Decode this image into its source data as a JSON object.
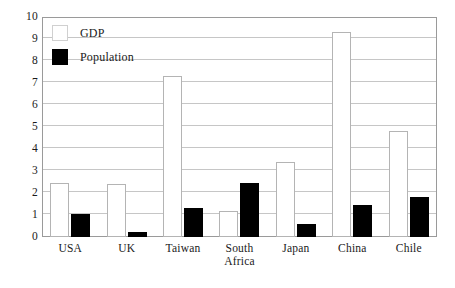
{
  "chart_data": {
    "type": "bar",
    "title": "",
    "xlabel": "",
    "ylabel": "",
    "ylim": [
      0,
      10
    ],
    "yticks": [
      0,
      1,
      2,
      3,
      4,
      5,
      6,
      7,
      8,
      9,
      10
    ],
    "grid": true,
    "legend_position": "top-left",
    "categories": [
      "USA",
      "UK",
      "Taiwan",
      "South Africa",
      "Japan",
      "China",
      "Chile"
    ],
    "series": [
      {
        "name": "GDP",
        "color": "#ffffff",
        "values": [
          2.45,
          2.4,
          7.3,
          1.2,
          3.4,
          9.3,
          4.8
        ]
      },
      {
        "name": "Population",
        "color": "#000000",
        "values": [
          1.05,
          0.25,
          1.3,
          2.45,
          0.6,
          1.45,
          1.8
        ]
      }
    ]
  },
  "legend": {
    "items": [
      {
        "label": "GDP",
        "swatch": "gdp"
      },
      {
        "label": "Population",
        "swatch": "population"
      }
    ]
  },
  "axis": {
    "y_tick_labels": [
      "10",
      "9",
      "8",
      "7",
      "6",
      "5",
      "4",
      "3",
      "2",
      "1",
      "0"
    ],
    "x_tick_labels": [
      [
        "USA"
      ],
      [
        "UK"
      ],
      [
        "Taiwan"
      ],
      [
        "South",
        "Africa"
      ],
      [
        "Japan"
      ],
      [
        "China"
      ],
      [
        "Chile"
      ]
    ]
  }
}
